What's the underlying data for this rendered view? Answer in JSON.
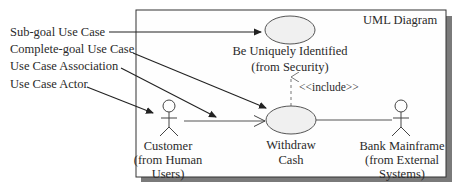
{
  "diagram": {
    "frame_title": "UML Diagram",
    "legend": [
      {
        "label": "Sub-goal Use Case"
      },
      {
        "label": "Complete-goal Use Case"
      },
      {
        "label": "Use Case Association"
      },
      {
        "label": "Use Case Actor"
      }
    ],
    "use_cases": [
      {
        "line1": "Be Uniquely Identified",
        "line2": "(from Security)"
      },
      {
        "line1": "Withdraw",
        "line2": "Cash"
      }
    ],
    "actors": [
      {
        "line1": "Customer",
        "line2": "(from Human",
        "line3": "Users)"
      },
      {
        "line1": "Bank Mainframe",
        "line2": "(from External",
        "line3": "Systems)"
      }
    ],
    "include_label": "<<include>>",
    "colors": {
      "line": "#222222",
      "ellipse_fill": "#efefef",
      "shadow": "#7a7a7a",
      "dashed": "#8a8a8a"
    }
  }
}
